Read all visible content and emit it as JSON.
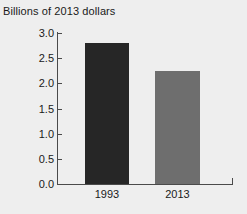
{
  "chart_data": {
    "type": "bar",
    "title": "Billions of 2013 dollars",
    "xlabel": "",
    "ylabel": "",
    "categories": [
      "1993",
      "2013"
    ],
    "values": [
      2.8,
      2.25
    ],
    "series": [
      {
        "name": "Billions of 2013 dollars",
        "values": [
          2.8,
          2.25
        ]
      }
    ],
    "bar_colors": [
      "#262626",
      "#6e6e6e"
    ],
    "ylim": [
      0.0,
      3.0
    ],
    "yticks": [
      "0.0",
      "0.5",
      "1.0",
      "1.5",
      "2.0",
      "2.5",
      "3.0"
    ],
    "ytick_values": [
      0.0,
      0.5,
      1.0,
      1.5,
      2.0,
      2.5,
      3.0
    ],
    "grid": false,
    "legend": "none",
    "background_color": "#eeeeee",
    "axis_color": "#4a4a4a",
    "text_color": "#1a1a1a"
  }
}
